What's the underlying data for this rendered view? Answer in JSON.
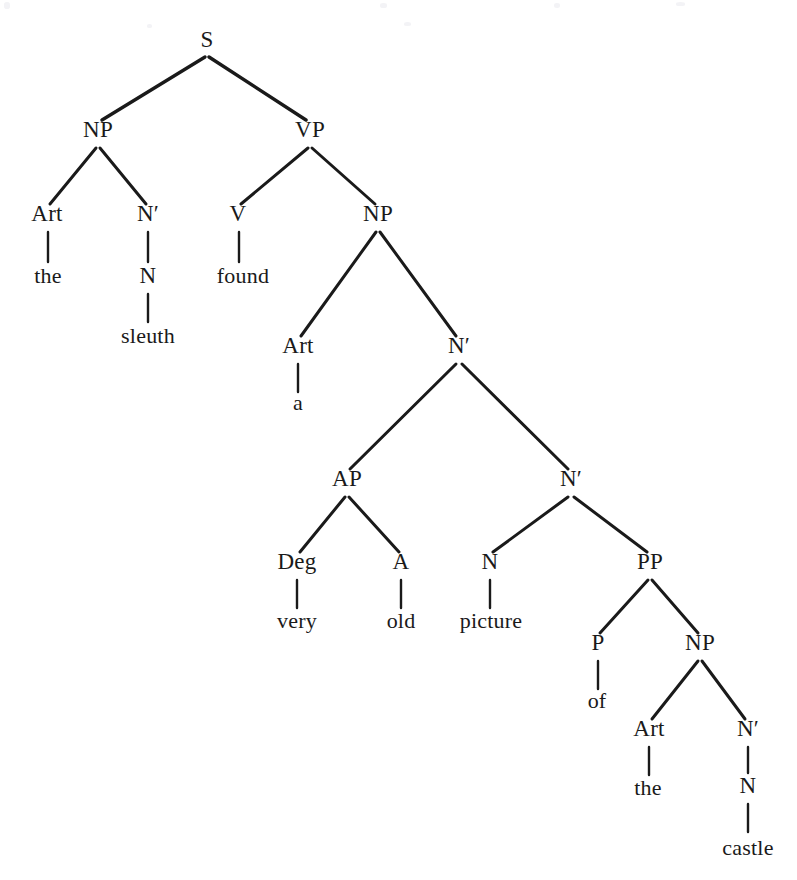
{
  "diagram": {
    "kind": "syntax-tree",
    "sentence": "the sleuth found a very old picture of the castle",
    "background_color": "#ffffff",
    "ink_color": "#1a1a1a",
    "nodes": [
      {
        "id": "S",
        "label": "S",
        "type": "category",
        "x": 207,
        "y": 47
      },
      {
        "id": "NP1",
        "label": "NP",
        "type": "category",
        "x": 98,
        "y": 137
      },
      {
        "id": "VP",
        "label": "VP",
        "type": "category",
        "x": 310,
        "y": 137
      },
      {
        "id": "Art1",
        "label": "Art",
        "type": "category",
        "x": 47,
        "y": 221
      },
      {
        "id": "Nbar1",
        "label": "N′",
        "type": "category",
        "x": 148,
        "y": 221
      },
      {
        "id": "V",
        "label": "V",
        "type": "category",
        "x": 238,
        "y": 221
      },
      {
        "id": "NP2",
        "label": "NP",
        "type": "category",
        "x": 378,
        "y": 221
      },
      {
        "id": "the1",
        "label": "the",
        "type": "word",
        "x": 48,
        "y": 283
      },
      {
        "id": "N1",
        "label": "N",
        "type": "category",
        "x": 148,
        "y": 283
      },
      {
        "id": "found",
        "label": "found",
        "type": "word",
        "x": 243,
        "y": 283
      },
      {
        "id": "sleuth",
        "label": "sleuth",
        "type": "word",
        "x": 148,
        "y": 343
      },
      {
        "id": "Art2",
        "label": "Art",
        "type": "category",
        "x": 298,
        "y": 353
      },
      {
        "id": "Nbar2",
        "label": "N′",
        "type": "category",
        "x": 459,
        "y": 353
      },
      {
        "id": "a",
        "label": "a",
        "type": "word",
        "x": 298,
        "y": 410
      },
      {
        "id": "AP",
        "label": "AP",
        "type": "category",
        "x": 347,
        "y": 486
      },
      {
        "id": "Nbar3",
        "label": "N′",
        "type": "category",
        "x": 571,
        "y": 486
      },
      {
        "id": "Deg",
        "label": "Deg",
        "type": "category",
        "x": 297,
        "y": 569
      },
      {
        "id": "A",
        "label": "A",
        "type": "category",
        "x": 401,
        "y": 569
      },
      {
        "id": "N2",
        "label": "N",
        "type": "category",
        "x": 490,
        "y": 569
      },
      {
        "id": "PP",
        "label": "PP",
        "type": "category",
        "x": 650,
        "y": 569
      },
      {
        "id": "very",
        "label": "very",
        "type": "word",
        "x": 297,
        "y": 628
      },
      {
        "id": "old",
        "label": "old",
        "type": "word",
        "x": 401,
        "y": 628
      },
      {
        "id": "picture",
        "label": "picture",
        "type": "word",
        "x": 491,
        "y": 628
      },
      {
        "id": "P",
        "label": "P",
        "type": "category",
        "x": 598,
        "y": 650
      },
      {
        "id": "NP3",
        "label": "NP",
        "type": "category",
        "x": 700,
        "y": 650
      },
      {
        "id": "of",
        "label": "of",
        "type": "word",
        "x": 597,
        "y": 708
      },
      {
        "id": "Art3",
        "label": "Art",
        "type": "category",
        "x": 649,
        "y": 736
      },
      {
        "id": "Nbar4",
        "label": "N′",
        "type": "category",
        "x": 748,
        "y": 736
      },
      {
        "id": "the2",
        "label": "the",
        "type": "word",
        "x": 648,
        "y": 795
      },
      {
        "id": "N3",
        "label": "N",
        "type": "category",
        "x": 748,
        "y": 793
      },
      {
        "id": "castle",
        "label": "castle",
        "type": "word",
        "x": 748,
        "y": 855
      }
    ],
    "edges": [
      {
        "from": "S",
        "to": "NP1",
        "style": "branch",
        "x1": 205,
        "y1": 57,
        "x2": 102,
        "y2": 120,
        "width": 3.4
      },
      {
        "from": "S",
        "to": "VP",
        "style": "branch",
        "x1": 209,
        "y1": 57,
        "x2": 306,
        "y2": 120,
        "width": 3.4
      },
      {
        "from": "NP1",
        "to": "Art1",
        "style": "branch",
        "x1": 96,
        "y1": 148,
        "x2": 50,
        "y2": 204,
        "width": 3.0
      },
      {
        "from": "NP1",
        "to": "Nbar1",
        "style": "branch",
        "x1": 100,
        "y1": 148,
        "x2": 146,
        "y2": 204,
        "width": 3.0
      },
      {
        "from": "VP",
        "to": "V",
        "style": "branch",
        "x1": 308,
        "y1": 148,
        "x2": 241,
        "y2": 204,
        "width": 3.0
      },
      {
        "from": "VP",
        "to": "NP2",
        "style": "branch",
        "x1": 312,
        "y1": 148,
        "x2": 375,
        "y2": 204,
        "width": 3.0
      },
      {
        "from": "Art1",
        "to": "the1",
        "style": "stem",
        "x1": 48,
        "y1": 232,
        "x2": 48,
        "y2": 262,
        "width": 2.4
      },
      {
        "from": "Nbar1",
        "to": "N1",
        "style": "stem",
        "x1": 148,
        "y1": 232,
        "x2": 148,
        "y2": 262,
        "width": 2.4
      },
      {
        "from": "V",
        "to": "found",
        "style": "stem",
        "x1": 239,
        "y1": 232,
        "x2": 239,
        "y2": 262,
        "width": 2.4
      },
      {
        "from": "N1",
        "to": "sleuth",
        "style": "stem",
        "x1": 148,
        "y1": 294,
        "x2": 148,
        "y2": 322,
        "width": 2.4
      },
      {
        "from": "NP2",
        "to": "Art2",
        "style": "branch",
        "x1": 376,
        "y1": 232,
        "x2": 301,
        "y2": 336,
        "width": 3.0
      },
      {
        "from": "NP2",
        "to": "Nbar2",
        "style": "branch",
        "x1": 380,
        "y1": 232,
        "x2": 456,
        "y2": 336,
        "width": 3.0
      },
      {
        "from": "Art2",
        "to": "a",
        "style": "stem",
        "x1": 298,
        "y1": 364,
        "x2": 298,
        "y2": 392,
        "width": 2.4
      },
      {
        "from": "Nbar2",
        "to": "AP",
        "style": "branch",
        "x1": 456,
        "y1": 364,
        "x2": 350,
        "y2": 469,
        "width": 3.0
      },
      {
        "from": "Nbar2",
        "to": "Nbar3",
        "style": "branch",
        "x1": 462,
        "y1": 364,
        "x2": 568,
        "y2": 469,
        "width": 3.0
      },
      {
        "from": "AP",
        "to": "Deg",
        "style": "branch",
        "x1": 345,
        "y1": 497,
        "x2": 300,
        "y2": 552,
        "width": 3.0
      },
      {
        "from": "AP",
        "to": "A",
        "style": "branch",
        "x1": 349,
        "y1": 497,
        "x2": 399,
        "y2": 552,
        "width": 3.0
      },
      {
        "from": "Nbar3",
        "to": "N2",
        "style": "branch",
        "x1": 568,
        "y1": 497,
        "x2": 493,
        "y2": 552,
        "width": 3.0
      },
      {
        "from": "Nbar3",
        "to": "PP",
        "style": "branch",
        "x1": 574,
        "y1": 497,
        "x2": 647,
        "y2": 552,
        "width": 3.0
      },
      {
        "from": "Deg",
        "to": "very",
        "style": "stem",
        "x1": 297,
        "y1": 580,
        "x2": 297,
        "y2": 608,
        "width": 2.4
      },
      {
        "from": "A",
        "to": "old",
        "style": "stem",
        "x1": 401,
        "y1": 580,
        "x2": 401,
        "y2": 608,
        "width": 2.4
      },
      {
        "from": "N2",
        "to": "picture",
        "style": "stem",
        "x1": 490,
        "y1": 580,
        "x2": 490,
        "y2": 608,
        "width": 2.4
      },
      {
        "from": "PP",
        "to": "P",
        "style": "branch",
        "x1": 648,
        "y1": 580,
        "x2": 600,
        "y2": 633,
        "width": 3.0
      },
      {
        "from": "PP",
        "to": "NP3",
        "style": "branch",
        "x1": 652,
        "y1": 580,
        "x2": 698,
        "y2": 633,
        "width": 3.0
      },
      {
        "from": "P",
        "to": "of",
        "style": "stem",
        "x1": 598,
        "y1": 661,
        "x2": 598,
        "y2": 689,
        "width": 2.4
      },
      {
        "from": "NP3",
        "to": "Art3",
        "style": "branch",
        "x1": 698,
        "y1": 661,
        "x2": 652,
        "y2": 719,
        "width": 3.0
      },
      {
        "from": "NP3",
        "to": "Nbar4",
        "style": "branch",
        "x1": 702,
        "y1": 661,
        "x2": 745,
        "y2": 719,
        "width": 3.0
      },
      {
        "from": "Art3",
        "to": "the2",
        "style": "stem",
        "x1": 649,
        "y1": 747,
        "x2": 649,
        "y2": 775,
        "width": 2.4
      },
      {
        "from": "Nbar4",
        "to": "N3",
        "style": "stem",
        "x1": 748,
        "y1": 747,
        "x2": 748,
        "y2": 773,
        "width": 2.4
      },
      {
        "from": "N3",
        "to": "castle",
        "style": "stem",
        "x1": 748,
        "y1": 804,
        "x2": 748,
        "y2": 832,
        "width": 2.4
      }
    ],
    "specks": [
      {
        "x": 4,
        "y": 2,
        "w": 6,
        "h": 7
      },
      {
        "x": 380,
        "y": 3,
        "w": 7,
        "h": 5
      },
      {
        "x": 554,
        "y": 3,
        "w": 6,
        "h": 5
      },
      {
        "x": 676,
        "y": 2,
        "w": 9,
        "h": 4
      },
      {
        "x": 1170,
        "y": 3,
        "w": 5,
        "h": 5
      },
      {
        "x": 147,
        "y": 24,
        "w": 5,
        "h": 4
      },
      {
        "x": 404,
        "y": 22,
        "w": 7,
        "h": 4
      }
    ]
  }
}
